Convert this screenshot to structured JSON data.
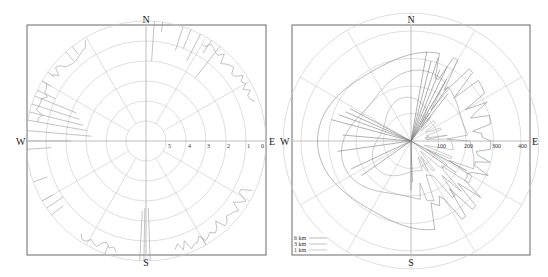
{
  "chart_data": [
    {
      "type": "polar-line",
      "title": "",
      "directions": [
        "N",
        "E",
        "S",
        "W"
      ],
      "radial_ticks": [
        "5",
        "4",
        "3",
        "2",
        "1",
        "0"
      ],
      "radial_direction": "decreasing-outward",
      "rlim": [
        5.5,
        0
      ],
      "angular_gridlines_deg": [
        0,
        30,
        60,
        90,
        120,
        150,
        180,
        210,
        240,
        270,
        300,
        330
      ],
      "series": [
        {
          "name": "horizon",
          "color": "#9a9a9a",
          "note": "sparse spikes near outer edge, strongest in NNE, NE, W-WNW and SSE-SE sectors; long spike to ~1.5 at S"
        }
      ]
    },
    {
      "type": "polar-line",
      "title": "",
      "directions": [
        "N",
        "E",
        "S",
        "W"
      ],
      "radial_ticks": [
        "100",
        "200",
        "300",
        "400"
      ],
      "rlim": [
        0,
        420
      ],
      "angular_gridlines_deg": [
        0,
        30,
        60,
        90,
        120,
        150,
        180,
        210,
        240,
        270,
        300,
        330
      ],
      "legend": {
        "position": "lower-left",
        "entries": [
          "6 km",
          "3 km",
          "1 km"
        ]
      },
      "series": [
        {
          "name": "6 km",
          "color": "#8a8a8a",
          "approx_radius_range": [
            290,
            340
          ]
        },
        {
          "name": "3 km",
          "color": "#9a9a9a",
          "approx_radius_range": [
            200,
            260
          ]
        },
        {
          "name": "1 km",
          "color": "#aaaaaa",
          "approx_radius_range": [
            110,
            160
          ]
        }
      ]
    }
  ],
  "left": {
    "labels": {
      "n": "N",
      "e": "E",
      "s": "S",
      "w": "W"
    },
    "ticks": [
      "5",
      "4",
      "3",
      "2",
      "1",
      "0"
    ]
  },
  "right": {
    "labels": {
      "n": "N",
      "e": "E",
      "s": "S",
      "w": "W",
      "w_outer": "E"
    },
    "ticks": [
      "100",
      "200",
      "300",
      "400"
    ],
    "legend": [
      {
        "label": "6 km",
        "color": "#8a8a8a"
      },
      {
        "label": "3 km",
        "color": "#9a9a9a"
      },
      {
        "label": "1 km",
        "color": "#aaaaaa"
      }
    ]
  }
}
